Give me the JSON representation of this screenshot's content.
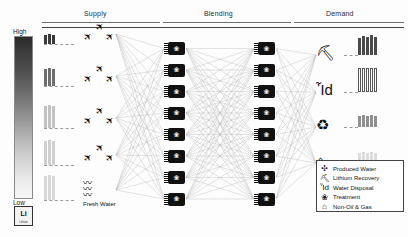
{
  "figure": {
    "stages": [
      {
        "label": "Supply",
        "x": 96,
        "rule_x": 42,
        "rule_w": 118
      },
      {
        "label": "Blending",
        "x": 216,
        "rule_x": 163,
        "rule_w": 128
      },
      {
        "label": "Demand",
        "x": 335,
        "rule_x": 294,
        "rule_w": 110
      }
    ]
  },
  "colorbar": {
    "name": "volume-colorbar",
    "high_label": "High",
    "low_label": "Low",
    "high_color": "#2a2a2a",
    "low_color": "#f7f7f7",
    "chip": {
      "symbol": "Li",
      "name": "Lithium"
    }
  },
  "supply": {
    "nodes": [
      {
        "id": "s1",
        "bar_values": [
          9,
          10,
          9
        ],
        "bar_shade": "#3a3a3a",
        "icon": "produced-water-plane",
        "plane_count": 3
      },
      {
        "id": "s2",
        "bar_values": [
          17,
          18,
          17
        ],
        "bar_shade": "#6e6e6e",
        "icon": "produced-water-plane",
        "plane_count": 3
      },
      {
        "id": "s3",
        "bar_values": [
          22,
          23,
          22
        ],
        "bar_shade": "#c2c2c2",
        "icon": "produced-water-plane",
        "plane_count": 3
      },
      {
        "id": "s4",
        "bar_values": [
          24,
          25,
          24
        ],
        "bar_shade": "#cfcfcf",
        "icon": "produced-water-plane",
        "plane_count": 3
      },
      {
        "id": "s5",
        "bar_values": [
          24,
          25,
          24
        ],
        "bar_shade": "#d8d8d8",
        "icon": "fresh-water-wave",
        "plane_count": 0,
        "label": "Fresh Water"
      }
    ]
  },
  "blending": {
    "column_a_count": 8,
    "column_b_count": 8,
    "node_icon": "treatment-node"
  },
  "demand": {
    "nodes": [
      {
        "id": "d1",
        "icon": "lithium-recovery-mining",
        "bar_values": [
          17,
          19,
          18,
          20,
          18
        ],
        "bar_shade": "#4a4a4a",
        "open": false
      },
      {
        "id": "d2",
        "icon": "water-disposal-wells",
        "bar_values": [
          24,
          24,
          24,
          24,
          24
        ],
        "bar_shade": "#ffffff",
        "open": true
      },
      {
        "id": "d3",
        "icon": "treatment-recycle",
        "bar_values": [
          11,
          12,
          11,
          12,
          11
        ],
        "bar_shade": "#8f8f8f",
        "open": false
      },
      {
        "id": "d4",
        "icon": "non-oil-and-gas-barn",
        "bar_values": [
          10,
          11,
          10,
          11,
          10
        ],
        "bar_shade": "#dcdcdc",
        "open": false
      }
    ]
  },
  "legend": {
    "name": "icon-legend",
    "items": [
      {
        "glyph": "produced-water-icon",
        "symbol": "✣",
        "label": "Produced Water"
      },
      {
        "glyph": "lithium-recovery-icon",
        "symbol": "⛏",
        "label": "Lithium Recovery"
      },
      {
        "glyph": "water-disposal-icon",
        "symbol": "Ἶd",
        "label": "Water Disposal"
      },
      {
        "glyph": "treatment-icon",
        "symbol": "❀",
        "label": "Treatment"
      },
      {
        "glyph": "non-oil-gas-icon",
        "symbol": "⌂",
        "label": "Non-Oil & Gas"
      }
    ]
  },
  "chart_data": {
    "type": "diagram",
    "stages": [
      "Supply",
      "Blending",
      "Demand"
    ],
    "colorbar": {
      "scale": "High to Low",
      "high": "High",
      "low": "Low"
    },
    "supply_series": [
      {
        "name": "s1",
        "values": [
          9,
          10,
          9
        ]
      },
      {
        "name": "s2",
        "values": [
          17,
          18,
          17
        ]
      },
      {
        "name": "s3",
        "values": [
          22,
          23,
          22
        ]
      },
      {
        "name": "s4",
        "values": [
          24,
          25,
          24
        ]
      },
      {
        "name": "s5-fresh-water",
        "values": [
          24,
          25,
          24
        ]
      }
    ],
    "demand_series": [
      {
        "name": "Lithium Recovery",
        "values": [
          17,
          19,
          18,
          20,
          18
        ]
      },
      {
        "name": "Water Disposal",
        "values": [
          24,
          24,
          24,
          24,
          24
        ]
      },
      {
        "name": "Treatment",
        "values": [
          11,
          12,
          11,
          12,
          11
        ]
      },
      {
        "name": "Non-Oil & Gas",
        "values": [
          10,
          11,
          10,
          11,
          10
        ]
      }
    ],
    "blending_nodes": {
      "column_a": 8,
      "column_b": 8
    }
  }
}
